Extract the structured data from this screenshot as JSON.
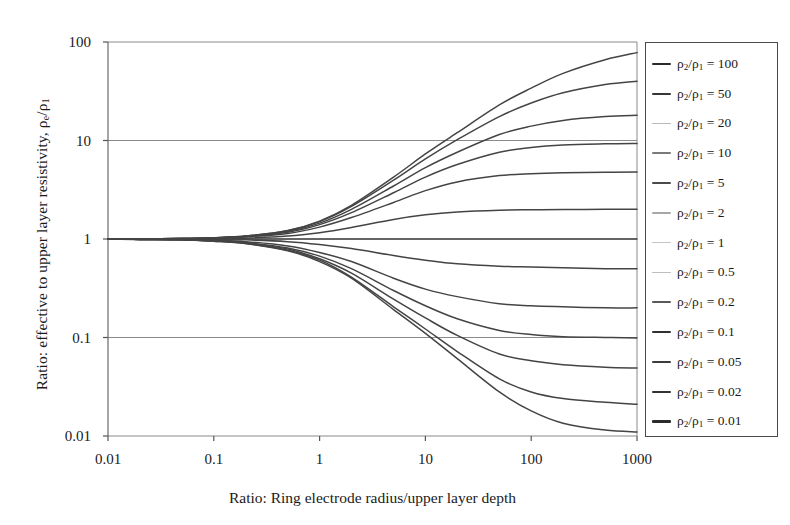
{
  "axes": {
    "x_label": "Ratio: Ring electrode radius/upper layer depth",
    "y_label_plain": "Ratio: effective to upper layer resistivity, ρe/ρ1",
    "x_ticks": [
      "0.01",
      "0.1",
      "1",
      "10",
      "100",
      "1000"
    ],
    "y_ticks": [
      "100",
      "10",
      "1",
      "0.1",
      "0.01"
    ]
  },
  "legend": {
    "entries": [
      {
        "label": "ρ2/ρ1 = 100",
        "ratio": 100,
        "color": "#2b2b2b",
        "width": 2.1
      },
      {
        "label": "ρ2/ρ1 = 50",
        "ratio": 50,
        "color": "#363636",
        "width": 2.0
      },
      {
        "label": "ρ2/ρ1 = 20",
        "ratio": 20,
        "color": "#b9b9b9",
        "width": 1.3
      },
      {
        "label": "ρ2/ρ1 = 10",
        "ratio": 10,
        "color": "#7a7a7a",
        "width": 1.5
      },
      {
        "label": "ρ2/ρ1 = 5",
        "ratio": 5,
        "color": "#4a4a4a",
        "width": 1.9
      },
      {
        "label": "ρ2/ρ1 = 2",
        "ratio": 2,
        "color": "#a8a8a8",
        "width": 1.3
      },
      {
        "label": "ρ2/ρ1 = 1",
        "ratio": 1,
        "color": "#c4c4c4",
        "width": 1.2
      },
      {
        "label": "ρ2/ρ1 = 0.5",
        "ratio": 0.5,
        "color": "#bdbdbd",
        "width": 1.3
      },
      {
        "label": "ρ2/ρ1 = 0.2",
        "ratio": 0.2,
        "color": "#595959",
        "width": 1.8
      },
      {
        "label": "ρ2/ρ1 = 0.1",
        "ratio": 0.1,
        "color": "#303030",
        "width": 2.0
      },
      {
        "label": "ρ2/ρ1 = 0.05",
        "ratio": 0.05,
        "color": "#3b3b3b",
        "width": 2.0
      },
      {
        "label": "ρ2/ρ1 = 0.02",
        "ratio": 0.02,
        "color": "#333333",
        "width": 2.0
      },
      {
        "label": "ρ2/ρ1 = 0.01",
        "ratio": 0.01,
        "color": "#2b2b2b",
        "width": 2.1
      }
    ]
  },
  "chart_data": {
    "type": "line",
    "title": "",
    "xlabel": "Ratio: Ring electrode radius/upper layer depth",
    "ylabel": "Ratio: effective to upper layer resistivity, ρe/ρ1",
    "xscale": "log",
    "yscale": "log",
    "xlim": [
      0.01,
      1000
    ],
    "ylim": [
      0.01,
      100
    ],
    "xticks": [
      0.01,
      0.1,
      1,
      10,
      100,
      1000
    ],
    "yticks": [
      0.01,
      0.1,
      1,
      10,
      100
    ],
    "grid": "horizontal",
    "legend_position": "right-outside",
    "x": [
      0.01,
      0.02,
      0.05,
      0.1,
      0.2,
      0.5,
      1,
      2,
      5,
      10,
      20,
      50,
      100,
      200,
      500,
      1000
    ],
    "series": [
      {
        "name": "ρ2/ρ1 = 100",
        "k": 100,
        "values": [
          1.0,
          1.0,
          1.01,
          1.03,
          1.07,
          1.22,
          1.52,
          2.2,
          4.25,
          7.3,
          12.0,
          23.0,
          34.0,
          48.0,
          66.0,
          78.0
        ]
      },
      {
        "name": "ρ2/ρ1 = 50",
        "k": 50,
        "values": [
          1.0,
          1.0,
          1.01,
          1.03,
          1.07,
          1.21,
          1.5,
          2.14,
          3.95,
          6.5,
          10.2,
          17.5,
          24.0,
          30.5,
          37.0,
          40.0
        ]
      },
      {
        "name": "ρ2/ρ1 = 20",
        "k": 20,
        "values": [
          1.0,
          1.0,
          1.01,
          1.03,
          1.06,
          1.19,
          1.45,
          2.0,
          3.45,
          5.3,
          7.6,
          11.5,
          14.0,
          16.0,
          17.5,
          18.0
        ]
      },
      {
        "name": "ρ2/ρ1 = 10",
        "k": 10,
        "values": [
          1.0,
          1.0,
          1.01,
          1.02,
          1.06,
          1.17,
          1.4,
          1.85,
          2.95,
          4.25,
          5.7,
          7.6,
          8.5,
          9.0,
          9.25,
          9.35
        ]
      },
      {
        "name": "ρ2/ρ1 = 5",
        "k": 5,
        "values": [
          1.0,
          1.0,
          1.01,
          1.02,
          1.05,
          1.14,
          1.32,
          1.65,
          2.35,
          3.1,
          3.8,
          4.4,
          4.6,
          4.7,
          4.75,
          4.78
        ]
      },
      {
        "name": "ρ2/ρ1 = 2",
        "k": 2,
        "values": [
          1.0,
          1.0,
          1.0,
          1.01,
          1.02,
          1.07,
          1.16,
          1.31,
          1.58,
          1.76,
          1.88,
          1.96,
          1.98,
          1.99,
          2.0,
          2.0
        ]
      },
      {
        "name": "ρ2/ρ1 = 1",
        "k": 1,
        "values": [
          1.0,
          1.0,
          1.0,
          1.0,
          1.0,
          1.0,
          1.0,
          1.0,
          1.0,
          1.0,
          1.0,
          1.0,
          1.0,
          1.0,
          1.0,
          1.0
        ]
      },
      {
        "name": "ρ2/ρ1 = 0.5",
        "k": 0.5,
        "values": [
          1.0,
          1.0,
          1.0,
          0.99,
          0.98,
          0.94,
          0.88,
          0.8,
          0.68,
          0.61,
          0.56,
          0.53,
          0.52,
          0.51,
          0.5,
          0.5
        ]
      },
      {
        "name": "ρ2/ρ1 = 0.2",
        "k": 0.2,
        "values": [
          1.0,
          0.99,
          0.99,
          0.97,
          0.94,
          0.85,
          0.73,
          0.59,
          0.4,
          0.31,
          0.26,
          0.22,
          0.21,
          0.205,
          0.2,
          0.2
        ]
      },
      {
        "name": "ρ2/ρ1 = 0.1",
        "k": 0.1,
        "values": [
          1.0,
          0.99,
          0.98,
          0.96,
          0.92,
          0.81,
          0.67,
          0.5,
          0.3,
          0.21,
          0.155,
          0.118,
          0.107,
          0.102,
          0.1,
          0.099
        ]
      },
      {
        "name": "ρ2/ρ1 = 0.05",
        "k": 0.05,
        "values": [
          1.0,
          0.99,
          0.98,
          0.96,
          0.91,
          0.79,
          0.63,
          0.45,
          0.245,
          0.158,
          0.105,
          0.068,
          0.058,
          0.053,
          0.05,
          0.049
        ]
      },
      {
        "name": "ρ2/ρ1 = 0.02",
        "k": 0.02,
        "values": [
          1.0,
          0.99,
          0.98,
          0.95,
          0.9,
          0.77,
          0.61,
          0.41,
          0.205,
          0.122,
          0.072,
          0.038,
          0.028,
          0.024,
          0.022,
          0.021
        ]
      },
      {
        "name": "ρ2/ρ1 = 0.01",
        "k": 0.01,
        "values": [
          1.0,
          0.99,
          0.98,
          0.95,
          0.9,
          0.76,
          0.59,
          0.4,
          0.192,
          0.11,
          0.061,
          0.028,
          0.018,
          0.0135,
          0.0115,
          0.011
        ]
      }
    ]
  }
}
